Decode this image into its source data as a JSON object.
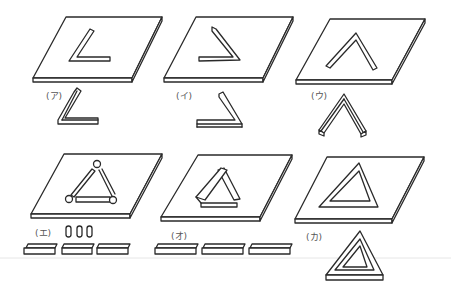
{
  "figure": {
    "panels": [
      {
        "id": "a",
        "label": "(ア)",
        "shape": "L-shaped bar (angle opening right)",
        "pieces": "single bent bar"
      },
      {
        "id": "i",
        "label": "(イ)",
        "shape": "reversed L-shaped bar (angle opening left)",
        "pieces": "single bent bar"
      },
      {
        "id": "u",
        "label": "(ウ)",
        "shape": "inverted V-shaped bar",
        "pieces": "single bent bar"
      },
      {
        "id": "e",
        "label": "(エ)",
        "shape": "triangle of three bars joined by round pegs",
        "pieces": "three bars and three pegs"
      },
      {
        "id": "o",
        "label": "(オ)",
        "shape": "triangle of three leaning bars",
        "pieces": "three bars"
      },
      {
        "id": "ka",
        "label": "(カ)",
        "shape": "solid triangular frame",
        "pieces": "one triangular frame"
      }
    ]
  }
}
